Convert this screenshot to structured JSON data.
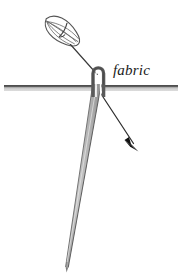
{
  "figure": {
    "type": "illustration",
    "background_color": "#ffffff",
    "width": 182,
    "height": 274
  },
  "labels": {
    "fabric": "fabric"
  },
  "colors": {
    "outline": "#4d4d4d",
    "needle_fill": "#b3b3b3",
    "needle_fill_light": "#c9c9c9",
    "needle_edge": "#6b6b6b",
    "fabric_top_edge": "#3a3a3a",
    "fabric_fill": "#bdbdbd",
    "thread_line": "#3a3a3a",
    "arrow_head": "#111111",
    "knot_outline": "#555555",
    "text": "#1a1a1a"
  },
  "parts": {
    "knot": {
      "name": "thread-knot",
      "center_x": 62,
      "center_y": 31,
      "rotation_deg": 35,
      "rx": 19,
      "ry": 11,
      "vein_count": 5
    },
    "needle_eye": {
      "name": "needle-eye-loop",
      "top_x": 98,
      "top_y": 66,
      "bottom_y": 97,
      "width": 9
    },
    "needle_shaft": {
      "name": "needle-shaft",
      "top_x": 97,
      "top_y": 86,
      "tip_x": 67,
      "tip_y": 268,
      "top_width": 9,
      "tip_width": 1
    },
    "fabric_line": {
      "name": "fabric-plane",
      "x_start": 4,
      "x_end": 178,
      "y": 87,
      "thickness": 5
    },
    "thread": {
      "name": "thread-path",
      "start_x": 70,
      "start_y": 44,
      "through_x": 97,
      "through_y": 74,
      "end_x": 133,
      "end_y": 143
    },
    "arrow": {
      "name": "direction-arrow",
      "tip_x": 137,
      "tip_y": 149,
      "angle_deg": 62
    }
  }
}
